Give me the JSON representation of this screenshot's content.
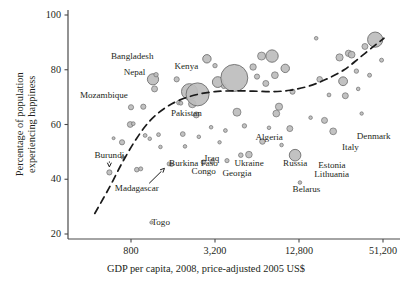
{
  "chart_data": {
    "type": "scatter",
    "title": "",
    "xlabel": "GDP per capita, 2008, price-adjusted 2005 US$",
    "ylabel": "Percentage of population experiencing happiness",
    "xscale": "log",
    "xlim": [
      400,
      72000
    ],
    "ylim": [
      18,
      101
    ],
    "xticks": [
      800,
      3200,
      12800,
      51200
    ],
    "xtick_labels": [
      "800",
      "3,200",
      "12,800",
      "51,200"
    ],
    "yticks": [
      20,
      40,
      60,
      80,
      100
    ],
    "ytick_labels": [
      "20",
      "40",
      "60",
      "80",
      "100"
    ],
    "grid": false,
    "legend": null,
    "marker_fill": "#bdbdbd",
    "marker_stroke": "#6e6e6e",
    "trend_style": "dashed",
    "trend_color": "#1a1a1a",
    "size_encodes": "population",
    "annotations": [
      {
        "label": "Bangladesh",
        "x": 1150,
        "y": 84.5,
        "anchor": "end"
      },
      {
        "label": "Nepal",
        "x": 1020,
        "y": 79.0,
        "anchor": "end"
      },
      {
        "label": "Kenya",
        "x": 2000,
        "y": 81.0,
        "anchor": "middle"
      },
      {
        "label": "Mozambique",
        "x": 760,
        "y": 70.5,
        "anchor": "end"
      },
      {
        "label": "Pakistan",
        "x": 2000,
        "y": 64.0,
        "anchor": "middle"
      },
      {
        "label": "Burundi",
        "x": 560,
        "y": 48.5,
        "anchor": "middle",
        "arrow": "down"
      },
      {
        "label": "Madagascar",
        "x": 880,
        "y": 36.5,
        "anchor": "middle",
        "arrow": "up-right"
      },
      {
        "label": "Burkina Faso",
        "x": 1500,
        "y": 45.5,
        "anchor": "start"
      },
      {
        "label": "Togo",
        "x": 1120,
        "y": 24.0,
        "anchor": "start"
      },
      {
        "label": "Congo",
        "x": 2650,
        "y": 42.5,
        "anchor": "middle"
      },
      {
        "label": "Iraq",
        "x": 3050,
        "y": 47.5,
        "anchor": "middle"
      },
      {
        "label": "Georgia",
        "x": 4600,
        "y": 42.0,
        "anchor": "middle"
      },
      {
        "label": "Ukraine",
        "x": 5600,
        "y": 45.5,
        "anchor": "middle"
      },
      {
        "label": "Algeria",
        "x": 7800,
        "y": 55.0,
        "anchor": "middle"
      },
      {
        "label": "Russia",
        "x": 12000,
        "y": 45.5,
        "anchor": "middle"
      },
      {
        "label": "Belarus",
        "x": 14500,
        "y": 36.0,
        "anchor": "middle"
      },
      {
        "label": "Estonia",
        "x": 22000,
        "y": 45.0,
        "anchor": "middle"
      },
      {
        "label": "Lithuania",
        "x": 22000,
        "y": 41.5,
        "anchor": "middle"
      },
      {
        "label": "Italy",
        "x": 30000,
        "y": 51.5,
        "anchor": "middle"
      },
      {
        "label": "Denmark",
        "x": 44000,
        "y": 55.5,
        "anchor": "middle"
      }
    ],
    "points": [
      {
        "x": 560,
        "y": 42.5,
        "r": 2.6
      },
      {
        "x": 600,
        "y": 55.0,
        "r": 1.5
      },
      {
        "x": 690,
        "y": 53.5,
        "r": 2.6
      },
      {
        "x": 700,
        "y": 48.0,
        "r": 1.8
      },
      {
        "x": 790,
        "y": 60.0,
        "r": 2.9
      },
      {
        "x": 830,
        "y": 60.3,
        "r": 1.9
      },
      {
        "x": 800,
        "y": 66.3,
        "r": 2.6
      },
      {
        "x": 880,
        "y": 43.5,
        "r": 2.3
      },
      {
        "x": 940,
        "y": 43.8,
        "r": 2.0
      },
      {
        "x": 980,
        "y": 66.5,
        "r": 2.6
      },
      {
        "x": 1010,
        "y": 56.0,
        "r": 1.9
      },
      {
        "x": 1090,
        "y": 54.8,
        "r": 1.8
      },
      {
        "x": 1120,
        "y": 24.2,
        "r": 1.6
      },
      {
        "x": 1150,
        "y": 76.5,
        "r": 5.6
      },
      {
        "x": 1210,
        "y": 78.2,
        "r": 2.2
      },
      {
        "x": 1180,
        "y": 73.0,
        "r": 3.0
      },
      {
        "x": 1260,
        "y": 56.3,
        "r": 1.9
      },
      {
        "x": 1300,
        "y": 51.8,
        "r": 1.8
      },
      {
        "x": 1500,
        "y": 45.6,
        "r": 2.0
      },
      {
        "x": 1560,
        "y": 45.4,
        "r": 2.0
      },
      {
        "x": 1700,
        "y": 76.5,
        "r": 2.6
      },
      {
        "x": 1760,
        "y": 68.0,
        "r": 2.2
      },
      {
        "x": 1820,
        "y": 67.8,
        "r": 2.0
      },
      {
        "x": 1880,
        "y": 56.5,
        "r": 2.4
      },
      {
        "x": 1950,
        "y": 52.0,
        "r": 1.8
      },
      {
        "x": 2100,
        "y": 72.0,
        "r": 8.0
      },
      {
        "x": 2200,
        "y": 67.5,
        "r": 3.8
      },
      {
        "x": 2350,
        "y": 63.5,
        "r": 3.0
      },
      {
        "x": 2400,
        "y": 71.0,
        "r": 11.5
      },
      {
        "x": 2450,
        "y": 55.5,
        "r": 1.8
      },
      {
        "x": 2650,
        "y": 46.2,
        "r": 2.4
      },
      {
        "x": 2800,
        "y": 84.0,
        "r": 4.2
      },
      {
        "x": 3000,
        "y": 59.0,
        "r": 1.8
      },
      {
        "x": 3050,
        "y": 46.5,
        "r": 2.2
      },
      {
        "x": 3200,
        "y": 81.5,
        "r": 2.2
      },
      {
        "x": 3350,
        "y": 75.5,
        "r": 5.4
      },
      {
        "x": 3450,
        "y": 53.5,
        "r": 1.7
      },
      {
        "x": 3700,
        "y": 74.0,
        "r": 2.4
      },
      {
        "x": 3800,
        "y": 57.8,
        "r": 1.9
      },
      {
        "x": 3900,
        "y": 46.8,
        "r": 2.1
      },
      {
        "x": 4400,
        "y": 77.0,
        "r": 13.5
      },
      {
        "x": 4600,
        "y": 64.5,
        "r": 4.0
      },
      {
        "x": 4900,
        "y": 48.8,
        "r": 2.3
      },
      {
        "x": 5200,
        "y": 59.5,
        "r": 2.2
      },
      {
        "x": 5600,
        "y": 49.0,
        "r": 3.3
      },
      {
        "x": 6000,
        "y": 81.0,
        "r": 3.2
      },
      {
        "x": 6400,
        "y": 77.5,
        "r": 2.6
      },
      {
        "x": 6900,
        "y": 85.0,
        "r": 4.0
      },
      {
        "x": 7000,
        "y": 53.8,
        "r": 2.8
      },
      {
        "x": 7400,
        "y": 75.0,
        "r": 3.0
      },
      {
        "x": 7800,
        "y": 58.8,
        "r": 1.8
      },
      {
        "x": 8200,
        "y": 85.0,
        "r": 6.2
      },
      {
        "x": 8600,
        "y": 78.0,
        "r": 3.4
      },
      {
        "x": 8800,
        "y": 64.0,
        "r": 3.4
      },
      {
        "x": 9200,
        "y": 66.5,
        "r": 3.6
      },
      {
        "x": 9600,
        "y": 52.5,
        "r": 1.8
      },
      {
        "x": 10200,
        "y": 80.5,
        "r": 4.2
      },
      {
        "x": 11000,
        "y": 58.5,
        "r": 3.0
      },
      {
        "x": 11500,
        "y": 72.0,
        "r": 2.6
      },
      {
        "x": 12000,
        "y": 48.8,
        "r": 5.8
      },
      {
        "x": 13000,
        "y": 38.8,
        "r": 1.8
      },
      {
        "x": 15500,
        "y": 62.5,
        "r": 1.8
      },
      {
        "x": 17000,
        "y": 91.5,
        "r": 1.8
      },
      {
        "x": 18000,
        "y": 76.5,
        "r": 2.8
      },
      {
        "x": 19500,
        "y": 61.5,
        "r": 3.0
      },
      {
        "x": 21000,
        "y": 70.8,
        "r": 1.9
      },
      {
        "x": 22500,
        "y": 57.5,
        "r": 3.4
      },
      {
        "x": 25000,
        "y": 84.5,
        "r": 3.6
      },
      {
        "x": 26500,
        "y": 75.8,
        "r": 4.4
      },
      {
        "x": 27500,
        "y": 70.5,
        "r": 3.0
      },
      {
        "x": 29000,
        "y": 86.0,
        "r": 3.2
      },
      {
        "x": 30500,
        "y": 85.5,
        "r": 3.4
      },
      {
        "x": 33000,
        "y": 79.5,
        "r": 2.2
      },
      {
        "x": 34000,
        "y": 73.0,
        "r": 1.8
      },
      {
        "x": 36000,
        "y": 64.0,
        "r": 1.7
      },
      {
        "x": 38000,
        "y": 88.5,
        "r": 3.0
      },
      {
        "x": 41000,
        "y": 78.0,
        "r": 2.0
      },
      {
        "x": 45000,
        "y": 91.0,
        "r": 7.6
      },
      {
        "x": 50000,
        "y": 83.5,
        "r": 2.0
      }
    ],
    "trend_points": [
      {
        "x": 440,
        "y": 27.5
      },
      {
        "x": 560,
        "y": 37.0
      },
      {
        "x": 700,
        "y": 46.5
      },
      {
        "x": 880,
        "y": 55.0
      },
      {
        "x": 1100,
        "y": 61.5
      },
      {
        "x": 1400,
        "y": 66.0
      },
      {
        "x": 1800,
        "y": 69.0
      },
      {
        "x": 2400,
        "y": 71.0
      },
      {
        "x": 3200,
        "y": 72.0
      },
      {
        "x": 4400,
        "y": 72.3
      },
      {
        "x": 6000,
        "y": 72.2
      },
      {
        "x": 8200,
        "y": 72.0
      },
      {
        "x": 11000,
        "y": 72.5
      },
      {
        "x": 15000,
        "y": 74.0
      },
      {
        "x": 20000,
        "y": 76.5
      },
      {
        "x": 27000,
        "y": 80.0
      },
      {
        "x": 35000,
        "y": 84.5
      },
      {
        "x": 45000,
        "y": 89.0
      },
      {
        "x": 52000,
        "y": 91.5
      }
    ]
  }
}
